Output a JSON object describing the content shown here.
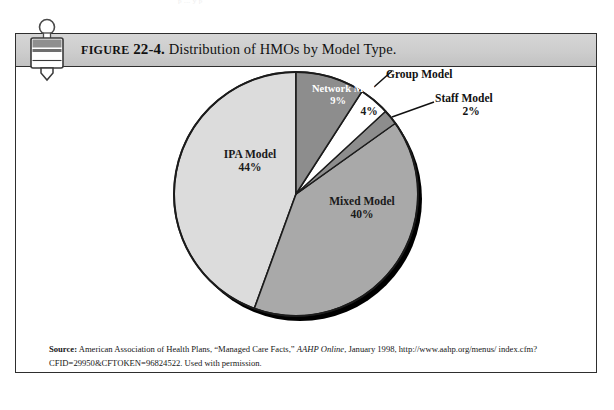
{
  "page": {
    "bleed_text": "p    ...     y   p"
  },
  "figure": {
    "label_prefix": "FIGURE",
    "number": "22-4.",
    "title": "Distribution of HMOs by Model Type.",
    "icon_name": "figure-bookmark-icon"
  },
  "source": {
    "label": "Source:",
    "text_part1": " American Association of Health Plans, “Managed Care Facts,” ",
    "italic": "AAHP Online",
    "text_part2": ", January 1998, http://www.aahp.org/menus/ index.cfm?CFID=29950&CFTOKEN=96824522. Used with permission."
  },
  "chart_data": {
    "type": "pie",
    "title": "Distribution of HMOs by Model Type",
    "xlabel": "",
    "ylabel": "",
    "legend_position": "none",
    "grid": false,
    "start_angle_deg": 0,
    "direction": "clockwise",
    "categories": [
      "Network Model",
      "Group Model",
      "Staff Model",
      "Mixed Model",
      "IPA Model"
    ],
    "values": [
      9,
      4,
      2,
      40,
      44
    ],
    "value_unit": "%",
    "slices": [
      {
        "name": "Network Model",
        "label": "Network Model",
        "value": 9,
        "value_label": "9%",
        "color": "#8d8d8d",
        "label_color": "#ffffff",
        "label_placement": "inside"
      },
      {
        "name": "Group Model",
        "label": "Group Model",
        "value": 4,
        "value_label": "4%",
        "color": "#ffffff",
        "label_color": "#111111",
        "label_placement": "leader-line"
      },
      {
        "name": "Staff Model",
        "label": "Staff Model",
        "value": 2,
        "value_label": "2%",
        "color": "#8d8d8d",
        "label_color": "#111111",
        "label_placement": "leader-line"
      },
      {
        "name": "Mixed Model",
        "label": "Mixed Model",
        "value": 40,
        "value_label": "40%",
        "color": "#a9a9a9",
        "label_color": "#1a1a1a",
        "label_placement": "inside"
      },
      {
        "name": "IPA Model",
        "label": "IPA Model",
        "value": 44,
        "value_label": "44%",
        "color": "#dcdcdc",
        "label_color": "#1a1a1a",
        "label_placement": "inside"
      }
    ],
    "shadow_color": "#000000",
    "outline_color": "#1b1b1b"
  }
}
